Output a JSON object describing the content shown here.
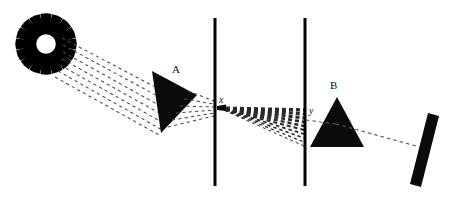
{
  "diagram": {
    "type": "optics-ray-diagram",
    "background_color": "#ffffff",
    "ink_color": "#000000",
    "ray_color": "#555555",
    "width": 453,
    "height": 199,
    "labels": {
      "prism_a": "A",
      "prism_b": "B",
      "slit_x": "x",
      "slit_y": "y"
    },
    "elements": [
      {
        "name": "sun",
        "kind": "light-source",
        "center": [
          46,
          44
        ],
        "ring_outer_radius": 17,
        "ring_inner_radius": 11,
        "ray_count": 16,
        "ray_length": 12
      },
      {
        "name": "prism-a",
        "kind": "prism",
        "label": "A",
        "orientation": "tilted",
        "vertices": [
          [
            152,
            71
          ],
          [
            196,
            94
          ],
          [
            161,
            132
          ]
        ]
      },
      {
        "name": "barrier-1",
        "kind": "barrier-with-slit",
        "x": 215,
        "y_top": 18,
        "y_bottom": 186,
        "thickness": 3,
        "slit_label": "x",
        "slit_y": 107
      },
      {
        "name": "barrier-2",
        "kind": "barrier-with-slit",
        "x": 305,
        "y_top": 18,
        "y_bottom": 186,
        "thickness": 3,
        "slit_label": "y",
        "slit_y": 119
      },
      {
        "name": "prism-b",
        "kind": "prism",
        "label": "B",
        "orientation": "upright",
        "vertices": [
          [
            336,
            97
          ],
          [
            363,
            146
          ],
          [
            309,
            146
          ]
        ]
      },
      {
        "name": "screen",
        "kind": "tilted-screen",
        "center": [
          424,
          150
        ],
        "angle_degrees": 12,
        "length": 72,
        "thickness": 11
      }
    ],
    "ray_bundles": [
      {
        "name": "sun-to-prism-a",
        "description": "Parallel dashed rays from the sun to prism A",
        "style": "dashed",
        "count": 7,
        "from": [
          63,
          52
        ],
        "to": [
          168,
          112
        ]
      },
      {
        "name": "prism-a-to-slit-x",
        "description": "Refracted dashed rays from prism A converging on slit x",
        "style": "dashed",
        "count": 5,
        "from": [
          178,
          104
        ],
        "to": [
          214,
          108
        ]
      },
      {
        "name": "slit-x-to-slit-y",
        "description": "Diverging fan of dashed rays spreading from slit x to barrier 2",
        "style": "dashed",
        "count": 9,
        "from": [
          218,
          108
        ],
        "to": [
          304,
          140
        ]
      },
      {
        "name": "prism-b-to-screen",
        "description": "Single dashed ray from prism B to the tilted screen",
        "style": "dashed",
        "count": 1,
        "from": [
          310,
          119
        ],
        "to": [
          414,
          144
        ]
      }
    ]
  }
}
